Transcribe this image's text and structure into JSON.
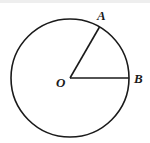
{
  "diagram": {
    "type": "circle-with-sector",
    "labels": {
      "center": "O",
      "point_a": "A",
      "point_b": "B"
    },
    "colors": {
      "stroke": "#1a1a1a",
      "background": "#ffffff"
    },
    "geometry": {
      "center": [
        70,
        78
      ],
      "radius": 59,
      "point_a": [
        99,
        26
      ],
      "point_b": [
        129,
        78
      ],
      "angle_aob_deg": 60
    }
  }
}
